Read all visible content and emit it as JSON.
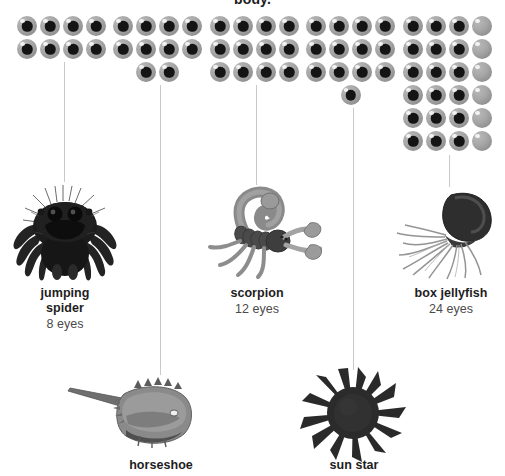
{
  "heading": "body.",
  "colors": {
    "eye_sphere": "#a6a6a6",
    "eye_pupil": "#141414",
    "connector": "#c9c9c9",
    "label_name": "#1d1d1d",
    "label_count": "#4a4a4a",
    "background": "#ffffff"
  },
  "creatures": [
    {
      "id": "jumping-spider",
      "name": "jumping\nspider",
      "name_line1": "jumping",
      "name_line2": "spider",
      "count_label": "8 eyes",
      "eye_count": 8,
      "eye_rows": [
        4,
        4
      ],
      "blank_column": null
    },
    {
      "id": "horseshoe-crab",
      "name": "horseshoe",
      "name_line1": "horseshoe",
      "name_line2": "",
      "count_label": "",
      "eye_count": 10,
      "eye_rows": [
        4,
        4,
        2
      ],
      "blank_column": null
    },
    {
      "id": "scorpion",
      "name": "scorpion",
      "name_line1": "scorpion",
      "name_line2": "",
      "count_label": "12 eyes",
      "eye_count": 12,
      "eye_rows": [
        4,
        4,
        4
      ],
      "blank_column": null
    },
    {
      "id": "sun-star",
      "name": "sun star",
      "name_line1": "sun star",
      "name_line2": "",
      "count_label": "",
      "eye_count": 13,
      "eye_rows": [
        4,
        4,
        4,
        1
      ],
      "blank_column": null
    },
    {
      "id": "box-jellyfish",
      "name": "box jellyfish",
      "name_line1": "box jellyfish",
      "name_line2": "",
      "count_label": "24 eyes",
      "eye_count": 24,
      "eye_rows": [
        4,
        4,
        4,
        4,
        4,
        4
      ],
      "blank_column": 4
    }
  ],
  "illustrations": {
    "jumping_spider": "jumping-spider-illustration",
    "scorpion": "scorpion-illustration",
    "box_jellyfish": "box-jellyfish-illustration",
    "horseshoe_crab": "horseshoe-crab-illustration",
    "sun_star": "sun-star-illustration"
  }
}
